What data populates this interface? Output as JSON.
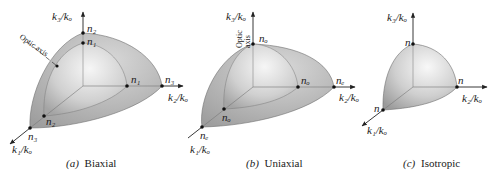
{
  "figure": {
    "panels": [
      {
        "id": "biaxial",
        "caption_prefix": "(a)",
        "caption": "Biaxial",
        "axes": {
          "k3": "k3/ko",
          "k2": "k2/ko",
          "k1": "k1/ko"
        },
        "optic_axis_label": "Optic axis",
        "points": {
          "top_outer": "n2",
          "top_inner": "n1",
          "right_inner": "n1",
          "right_outer": "n3",
          "front_inner": "n2",
          "front_outer": "n3"
        }
      },
      {
        "id": "uniaxial",
        "caption_prefix": "(b)",
        "caption": "Uniaxial",
        "axes": {
          "k3": "k3/ko",
          "k2": "k2/ko",
          "k1": "k1/ko"
        },
        "optic_axis_label": [
          "Optic",
          "axis"
        ],
        "points": {
          "top": "no",
          "right_inner": "no",
          "right_outer": "ne",
          "front_inner": "no",
          "front_outer": "ne"
        }
      },
      {
        "id": "isotropic",
        "caption_prefix": "(c)",
        "caption": "Isotropic",
        "axes": {
          "k3": "k3/ko",
          "k2": "k2/ko",
          "k1": "k1/ko"
        },
        "points": {
          "top": "n",
          "right": "n",
          "front": "n"
        }
      }
    ],
    "colors": {
      "outer_surface": "#b4b4b4",
      "inner_surface_light": "#f2f2f2",
      "inner_surface_dark": "#a6a6a6",
      "axis": "#222222"
    }
  }
}
